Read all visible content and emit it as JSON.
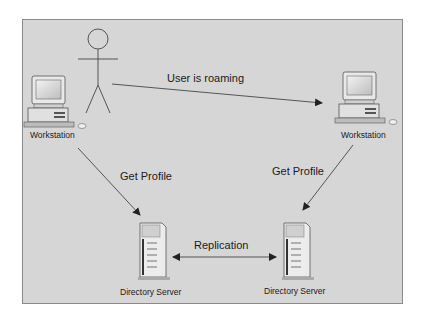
{
  "diagram": {
    "nodes": {
      "user": {
        "label": ""
      },
      "workstation_left": {
        "label": "Workstation"
      },
      "workstation_right": {
        "label": "Workstation"
      },
      "server_left": {
        "label": "Directory Server"
      },
      "server_right": {
        "label": "Directory Server"
      }
    },
    "edges": {
      "roaming": {
        "label": "User is roaming"
      },
      "get_profile_left": {
        "label": "Get Profile"
      },
      "get_profile_right": {
        "label": "Get Profile"
      },
      "replication": {
        "label": "Replication"
      }
    },
    "colors": {
      "background": "#d6d6d6",
      "border": "#8a8a8a",
      "line": "#333333"
    }
  }
}
